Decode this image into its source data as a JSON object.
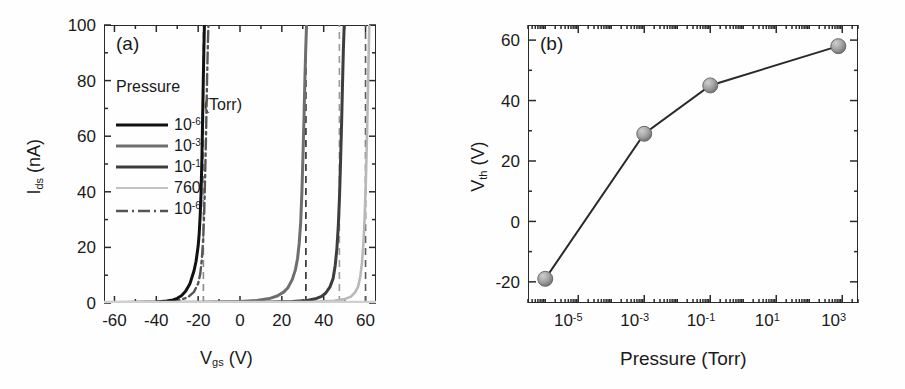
{
  "figure": {
    "panel_a_tag": "(a)",
    "panel_b_tag": "(b)"
  },
  "panel_a": {
    "tag": "(a)",
    "ylabel_main": "I",
    "ylabel_sub": "ds",
    "ylabel_unit": " (nA)",
    "xlabel_main": "V",
    "xlabel_sub": "gs",
    "xlabel_unit": " (V)",
    "y_ticks": [
      "0",
      "20",
      "40",
      "60",
      "80",
      "100"
    ],
    "x_ticks": [
      "-60",
      "-40",
      "-20",
      "0",
      "20",
      "40",
      "60"
    ],
    "legend": {
      "title_line1": "Pressure",
      "title_line2": "(Torr)",
      "entries": [
        {
          "label_base": "10",
          "label_exp": "-6",
          "style": "solid",
          "color": "#111111",
          "width": 3.0
        },
        {
          "label_base": "10",
          "label_exp": "-3",
          "style": "solid",
          "color": "#6e6e6e",
          "width": 3.0
        },
        {
          "label_base": "10",
          "label_exp": "-1",
          "style": "solid",
          "color": "#3d3d3d",
          "width": 3.0
        },
        {
          "label_base": "760",
          "label_exp": "",
          "style": "solid",
          "color": "#b8b8b8",
          "width": 2.4
        },
        {
          "label_base": "10",
          "label_exp": "-6",
          "style": "dashdot",
          "color": "#555555",
          "width": 2.2
        }
      ]
    }
  },
  "panel_b": {
    "tag": "(b)",
    "ylabel_main": "V",
    "ylabel_sub": "th",
    "ylabel_unit": " (V)",
    "xlabel": "Pressure (Torr)",
    "y_ticks": [
      "-20",
      "0",
      "20",
      "40",
      "60"
    ],
    "x_ticks": [
      {
        "base": "10",
        "exp": "-5"
      },
      {
        "base": "10",
        "exp": "-3"
      },
      {
        "base": "10",
        "exp": "-1"
      },
      {
        "base": "10",
        "exp": "1"
      },
      {
        "base": "10",
        "exp": "3"
      }
    ]
  },
  "chart_data": [
    {
      "type": "line",
      "panel": "(a)",
      "title": "",
      "xlabel": "V_gs (V)",
      "ylabel": "I_ds (nA)",
      "xlim": [
        -65,
        65
      ],
      "ylim": [
        0,
        100
      ],
      "xscale": "linear",
      "yscale": "linear",
      "grid": false,
      "legend_position": "upper-left-inside",
      "legend_title": "Pressure (Torr)",
      "series": [
        {
          "name": "10^-6",
          "style": "solid",
          "color": "#111111",
          "threshold_voltage": -19,
          "x": [
            -65,
            -55,
            -45,
            -40,
            -35,
            -32,
            -30,
            -28,
            -26,
            -24,
            -22,
            -21,
            -20,
            -19.5,
            -19,
            -18.6,
            -18.2,
            -17.9,
            -17.6,
            -17.3,
            -17.0
          ],
          "y": [
            0.2,
            0.2,
            0.3,
            0.4,
            0.7,
            1.1,
            1.7,
            2.6,
            4.2,
            6.8,
            11.5,
            15.0,
            20.5,
            25.0,
            32.0,
            40.0,
            52.0,
            65.0,
            78.0,
            90.0,
            100
          ]
        },
        {
          "name": "10^-3",
          "style": "solid",
          "color": "#6e6e6e",
          "threshold_voltage": 29,
          "x": [
            -65,
            -40,
            -20,
            0,
            8,
            14,
            18,
            21,
            23,
            25,
            26.5,
            27.5,
            28.3,
            29.0,
            29.6,
            30.1,
            30.6,
            31.0,
            31.4,
            31.8
          ],
          "y": [
            0.2,
            0.25,
            0.3,
            0.5,
            0.9,
            1.6,
            2.6,
            4.0,
            5.6,
            8.5,
            12.0,
            16.0,
            21.5,
            29.0,
            40.0,
            53.0,
            67.0,
            80.0,
            91.0,
            100
          ]
        },
        {
          "name": "10^-1",
          "style": "solid",
          "color": "#3d3d3d",
          "threshold_voltage": 45,
          "x": [
            -65,
            -20,
            10,
            25,
            32,
            36,
            39,
            41,
            43,
            44.5,
            45.5,
            46.3,
            47.0,
            47.6,
            48.1,
            48.6,
            49.0,
            49.4,
            49.8
          ],
          "y": [
            0.15,
            0.2,
            0.3,
            0.5,
            0.9,
            1.5,
            2.4,
            3.6,
            5.8,
            8.8,
            13.5,
            19.5,
            28.0,
            39.0,
            52.0,
            66.0,
            79.0,
            91.0,
            100
          ]
        },
        {
          "name": "760",
          "style": "solid",
          "color": "#b8b8b8",
          "threshold_voltage": 58,
          "x": [
            -65,
            -20,
            15,
            35,
            45,
            50,
            53,
            55,
            56.5,
            57.5,
            58.3,
            59.0,
            59.6,
            60.1,
            60.6,
            61.0,
            61.4,
            61.8
          ],
          "y": [
            0.1,
            0.15,
            0.25,
            0.4,
            0.8,
            1.4,
            2.3,
            3.8,
            6.0,
            9.5,
            14.5,
            21.5,
            31.0,
            43.0,
            57.0,
            71.0,
            86.0,
            100
          ]
        },
        {
          "name": "10^-6 (recovery)",
          "style": "dashdot",
          "color": "#555555",
          "threshold_voltage": -17,
          "x": [
            -65,
            -40,
            -30,
            -25,
            -22,
            -20,
            -19,
            -18.2,
            -17.6,
            -17.1,
            -16.7,
            -16.3,
            -16.0,
            -15.7,
            -15.4,
            -15.1
          ],
          "y": [
            0.2,
            0.3,
            0.8,
            2.0,
            4.0,
            7.0,
            10.5,
            16.0,
            23.0,
            33.0,
            45.0,
            58.0,
            70.0,
            82.0,
            92.0,
            100
          ]
        }
      ],
      "vertical_dashed_markers": [
        {
          "x": -17.5,
          "label": "V_th 10^-6",
          "color": "#8a8a8a"
        },
        {
          "x": 31.5,
          "label": "V_th 10^-3",
          "color": "#2a2a2a"
        },
        {
          "x": 47.5,
          "label": "V_th 10^-1",
          "color": "#9a9a9a"
        },
        {
          "x": 60.0,
          "label": "V_th 760",
          "color": "#5a5a5a"
        }
      ]
    },
    {
      "type": "line",
      "panel": "(b)",
      "title": "",
      "xlabel": "Pressure (Torr)",
      "ylabel": "V_th (V)",
      "xscale": "log",
      "yscale": "linear",
      "xlim": [
        3e-07,
        3000.0
      ],
      "ylim": [
        -27,
        65
      ],
      "grid": false,
      "marker": "circle",
      "marker_color": "#9a9a9a",
      "line_color": "#2a2a2a",
      "x": [
        1e-06,
        0.001,
        0.1,
        760
      ],
      "y": [
        -19,
        29,
        45,
        58
      ],
      "x_labels": [
        "10^-6",
        "10^-3",
        "10^-1",
        "760"
      ]
    }
  ]
}
